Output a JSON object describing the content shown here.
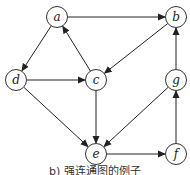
{
  "diagram": {
    "type": "directed-graph",
    "nodes": [
      {
        "id": "a",
        "label": "a",
        "x": 57,
        "y": 17
      },
      {
        "id": "b",
        "label": "b",
        "x": 176,
        "y": 17
      },
      {
        "id": "c",
        "label": "c",
        "x": 96,
        "y": 80
      },
      {
        "id": "d",
        "label": "d",
        "x": 16,
        "y": 80
      },
      {
        "id": "g",
        "label": "g",
        "x": 176,
        "y": 80
      },
      {
        "id": "e",
        "label": "e",
        "x": 96,
        "y": 154
      },
      {
        "id": "f",
        "label": "f",
        "x": 176,
        "y": 154
      }
    ],
    "edges": [
      {
        "from": "a",
        "to": "b"
      },
      {
        "from": "a",
        "to": "d"
      },
      {
        "from": "b",
        "to": "c"
      },
      {
        "from": "c",
        "to": "a"
      },
      {
        "from": "d",
        "to": "c"
      },
      {
        "from": "d",
        "to": "e"
      },
      {
        "from": "c",
        "to": "e"
      },
      {
        "from": "g",
        "to": "b"
      },
      {
        "from": "g",
        "to": "e"
      },
      {
        "from": "e",
        "to": "f"
      },
      {
        "from": "f",
        "to": "g"
      }
    ],
    "caption": "b) 强连通图的例子"
  }
}
